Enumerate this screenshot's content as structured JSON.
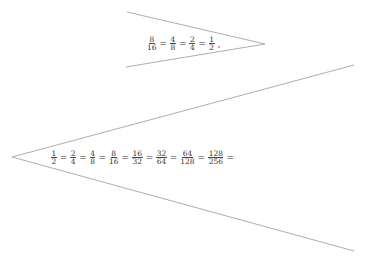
{
  "diagram": {
    "top_wedge": {
      "apex": [
        265,
        44
      ],
      "ends": [
        [
          127,
          12
        ],
        [
          126,
          67
        ]
      ],
      "fractions": [
        {
          "num": "8",
          "den": "16"
        },
        {
          "num": "4",
          "den": "8"
        },
        {
          "num": "2",
          "den": "4"
        },
        {
          "num": "1",
          "den": "2"
        }
      ],
      "separator": "=",
      "trailing": ","
    },
    "bottom_wedge": {
      "apex": [
        12,
        157
      ],
      "ends": [
        [
          354,
          65
        ],
        [
          354,
          251
        ]
      ],
      "fractions": [
        {
          "num": "1",
          "den": "2"
        },
        {
          "num": "2",
          "den": "4"
        },
        {
          "num": "4",
          "den": "8"
        },
        {
          "num": "8",
          "den": "16"
        },
        {
          "num": "16",
          "den": "32"
        },
        {
          "num": "32",
          "den": "64"
        },
        {
          "num": "64",
          "den": "128"
        },
        {
          "num": "128",
          "den": "256"
        }
      ],
      "separator": "=",
      "trailing": "="
    },
    "line_color": "#999999"
  }
}
